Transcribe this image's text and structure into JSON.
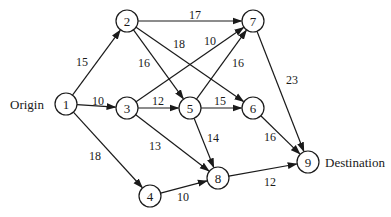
{
  "diagram": {
    "type": "directed-network",
    "terminals": {
      "origin": {
        "label": "Origin",
        "node": "1",
        "x": 10,
        "y": 104
      },
      "destination": {
        "label": "Destination",
        "node": "9",
        "x": 325,
        "y": 162
      }
    },
    "nodes": [
      {
        "id": "1",
        "label": "1",
        "x": 66,
        "y": 104
      },
      {
        "id": "2",
        "label": "2",
        "x": 127,
        "y": 21
      },
      {
        "id": "3",
        "label": "3",
        "x": 127,
        "y": 108
      },
      {
        "id": "4",
        "label": "4",
        "x": 150,
        "y": 196
      },
      {
        "id": "5",
        "label": "5",
        "x": 190,
        "y": 108
      },
      {
        "id": "6",
        "label": "6",
        "x": 253,
        "y": 108
      },
      {
        "id": "7",
        "label": "7",
        "x": 253,
        "y": 21
      },
      {
        "id": "8",
        "label": "8",
        "x": 218,
        "y": 178
      },
      {
        "id": "9",
        "label": "9",
        "x": 308,
        "y": 162
      }
    ],
    "edges": [
      {
        "from": "1",
        "to": "2",
        "weight": "15",
        "lx": 82,
        "ly": 62
      },
      {
        "from": "1",
        "to": "3",
        "weight": "10",
        "lx": 98,
        "ly": 101
      },
      {
        "from": "1",
        "to": "4",
        "weight": "18",
        "lx": 95,
        "ly": 156
      },
      {
        "from": "2",
        "to": "7",
        "weight": "17",
        "lx": 195,
        "ly": 15
      },
      {
        "from": "2",
        "to": "5",
        "weight": "16",
        "lx": 144,
        "ly": 63
      },
      {
        "from": "2",
        "to": "6",
        "weight": "18",
        "lx": 179,
        "ly": 44
      },
      {
        "from": "3",
        "to": "7",
        "weight": "10",
        "lx": 210,
        "ly": 41
      },
      {
        "from": "3",
        "to": "5",
        "weight": "12",
        "lx": 158,
        "ly": 101
      },
      {
        "from": "3",
        "to": "8",
        "weight": "13",
        "lx": 155,
        "ly": 146
      },
      {
        "from": "4",
        "to": "8",
        "weight": "10",
        "lx": 183,
        "ly": 197
      },
      {
        "from": "5",
        "to": "7",
        "weight": "16",
        "lx": 238,
        "ly": 63
      },
      {
        "from": "5",
        "to": "6",
        "weight": "15",
        "lx": 220,
        "ly": 101
      },
      {
        "from": "5",
        "to": "8",
        "weight": "14",
        "lx": 213,
        "ly": 138
      },
      {
        "from": "6",
        "to": "9",
        "weight": "16",
        "lx": 270,
        "ly": 137
      },
      {
        "from": "7",
        "to": "9",
        "weight": "23",
        "lx": 292,
        "ly": 80
      },
      {
        "from": "8",
        "to": "9",
        "weight": "12",
        "lx": 270,
        "ly": 182
      }
    ],
    "colors": {
      "stroke": "#1a1a1a",
      "background": "#ffffff"
    }
  }
}
